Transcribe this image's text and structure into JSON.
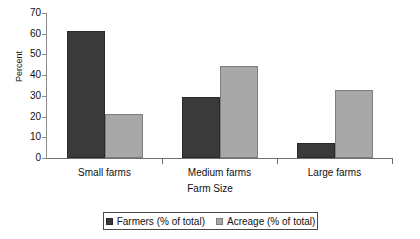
{
  "chart_data": {
    "type": "bar",
    "title": "",
    "xlabel": "Farm Size",
    "ylabel": "Percent",
    "categories": [
      "Small farms",
      "Medium farms",
      "Large farms"
    ],
    "series": [
      {
        "name": "Farmers (% of total)",
        "color": "#3a3a3a",
        "values": [
          61.3,
          29.5,
          7.2
        ]
      },
      {
        "name": "Acreage (% of total)",
        "color": "#a8a8a8",
        "values": [
          21.3,
          44.5,
          32.8
        ]
      }
    ],
    "ylim": [
      0,
      70
    ],
    "yticks": [
      0,
      10,
      20,
      30,
      40,
      50,
      60,
      70
    ],
    "ytick_labels": [
      "0",
      "10",
      "20",
      "30",
      "40",
      "50",
      "60",
      "70"
    ],
    "grid": false,
    "legend_position": "bottom"
  },
  "legend": {
    "items": [
      {
        "label": "Farmers (% of total)"
      },
      {
        "label": "Acreage (% of total)"
      }
    ]
  },
  "axes": {
    "y_title": "Percent",
    "x_title": "Farm Size"
  }
}
